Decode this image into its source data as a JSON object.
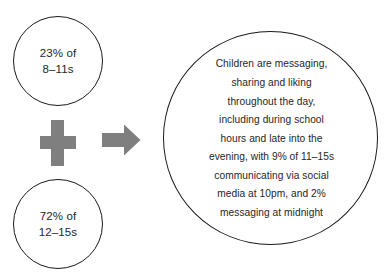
{
  "diagram": {
    "colors": {
      "stroke": "#1a1a1a",
      "text": "#262626",
      "operator_gray": "#7f7f7f",
      "background": "#ffffff"
    },
    "inputs": [
      {
        "id": "younger-children",
        "lines": [
          "23% of",
          "8–11s"
        ],
        "percent": "23%",
        "age_group": "8–11s"
      },
      {
        "id": "older-children",
        "lines": [
          "72% of",
          "12–15s"
        ],
        "percent": "72%",
        "age_group": "12–15s"
      }
    ],
    "operators": {
      "plus": "plus-icon",
      "arrow": "arrow-right-icon"
    },
    "summary": {
      "id": "summary-statement",
      "lines": [
        "Children are messaging,",
        "sharing and liking",
        "throughout the day,",
        "including during school",
        "hours and late into the",
        "evening, with 9% of 11–15s",
        "communicating via social",
        "media at 10pm, and 2%",
        "messaging at midnight"
      ],
      "full_text": "Children are messaging, sharing and liking throughout the day, including during school hours and late into the evening, with 9% of 11–15s communicating via social media at 10pm, and 2% messaging at midnight",
      "stats": [
        {
          "value": "9%",
          "group": "11–15s",
          "time": "10pm",
          "activity": "communicating via social media"
        },
        {
          "value": "2%",
          "time": "midnight",
          "activity": "messaging"
        }
      ]
    }
  }
}
